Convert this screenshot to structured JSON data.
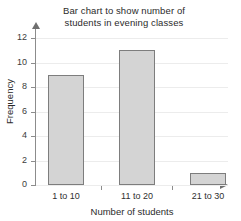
{
  "chart_data": {
    "type": "bar",
    "title": "Bar chart to show number of students in evening classes",
    "title_line1": "Bar chart to show number of",
    "title_line2": "students in evening classes",
    "xlabel": "Number of students",
    "ylabel": "Frequency",
    "categories": [
      "1 to 10",
      "11 to 20",
      "21 to 30"
    ],
    "values": [
      9,
      11,
      1
    ],
    "ylim": [
      0,
      12
    ],
    "ytick_labels": [
      "0",
      "2",
      "4",
      "6",
      "8",
      "10",
      "12"
    ],
    "ytick_values": [
      0,
      2,
      4,
      6,
      8,
      10,
      12
    ],
    "grid": "horizontal",
    "legend": "none",
    "bar_fill_color": "#d4d4d4",
    "bar_border_color": "#7d7d7d",
    "gridline_color": "#ececec",
    "axis_color": "#8c8c8c"
  }
}
